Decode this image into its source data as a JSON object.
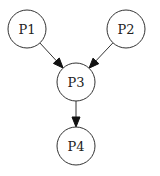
{
  "diagram": {
    "type": "directed-graph",
    "nodes": [
      {
        "id": "P1",
        "label": "P1",
        "cx": 27,
        "cy": 29,
        "r": 19
      },
      {
        "id": "P2",
        "label": "P2",
        "cx": 126,
        "cy": 29,
        "r": 19
      },
      {
        "id": "P3",
        "label": "P3",
        "cx": 76,
        "cy": 82,
        "r": 19
      },
      {
        "id": "P4",
        "label": "P4",
        "cx": 76,
        "cy": 146,
        "r": 19
      }
    ],
    "edges": [
      {
        "from": "P1",
        "to": "P3"
      },
      {
        "from": "P2",
        "to": "P3"
      },
      {
        "from": "P3",
        "to": "P4"
      }
    ],
    "colors": {
      "stroke": "#333333",
      "arrow": "#111111",
      "background": "#ffffff"
    }
  }
}
